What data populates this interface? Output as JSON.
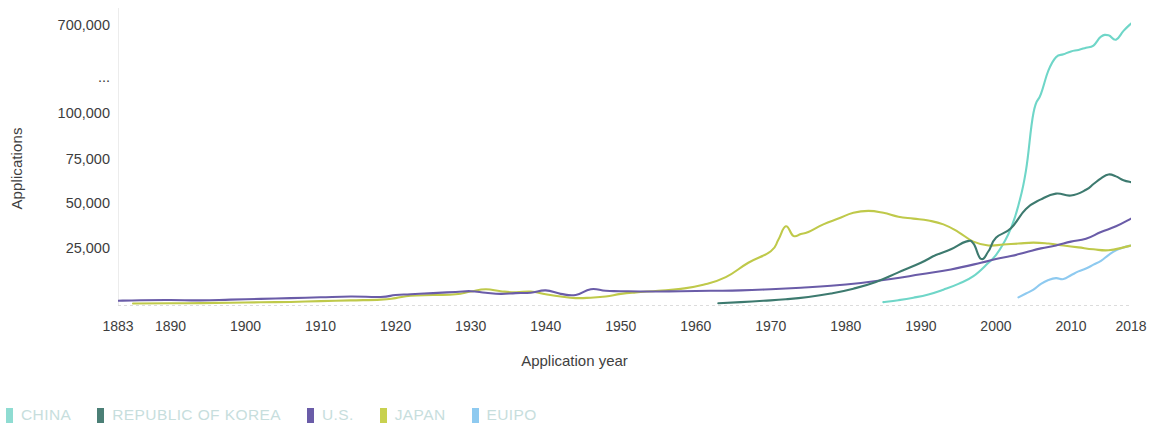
{
  "chart_data": {
    "type": "line",
    "title": "",
    "xlabel": "Application year",
    "ylabel": "Applications",
    "grid": false,
    "legend_position": "bottom-left",
    "axis_note": "y-axis is broken between 100,000 and 700,000, indicated by an ellipsis tick",
    "x_ticks": [
      "1883",
      "1890",
      "1900",
      "1910",
      "1920",
      "1930",
      "1940",
      "1950",
      "1960",
      "1970",
      "1980",
      "1990",
      "2000",
      "2010",
      "2018"
    ],
    "x_tick_values": [
      1883,
      1890,
      1900,
      1910,
      1920,
      1930,
      1940,
      1950,
      1960,
      1970,
      1980,
      1990,
      2000,
      2010,
      2018
    ],
    "y_ticks": [
      "25,000",
      "50,000",
      "75,000",
      "100,000",
      "...",
      "700,000"
    ],
    "y_tick_values": [
      25000,
      50000,
      75000,
      100000,
      null,
      700000
    ],
    "xlim": [
      1883,
      2018
    ],
    "ylim": [
      0,
      700000
    ],
    "series": [
      {
        "name": "CHINA",
        "color": "#6fd6c8",
        "x": [
          1985,
          1987,
          1989,
          1991,
          1993,
          1995,
          1997,
          1999,
          2000,
          2001,
          2002,
          2003,
          2004,
          2005,
          2006,
          2007,
          2008,
          2009,
          2010,
          2011,
          2012,
          2013,
          2014,
          2015,
          2016,
          2017,
          2018
        ],
        "values": [
          1500,
          2500,
          3800,
          5500,
          8000,
          11000,
          15000,
          22000,
          26000,
          32000,
          40000,
          52000,
          70000,
          100000,
          230000,
          390000,
          480000,
          500000,
          520000,
          530000,
          545000,
          560000,
          620000,
          630000,
          600000,
          660000,
          710000
        ]
      },
      {
        "name": "REPUBLIC OF KOREA",
        "color": "#3d7a6f",
        "x": [
          1963,
          1966,
          1969,
          1972,
          1975,
          1978,
          1981,
          1984,
          1987,
          1990,
          1992,
          1994,
          1996,
          1997,
          1998,
          1999,
          2000,
          2002,
          2004,
          2006,
          2008,
          2010,
          2012,
          2013,
          2014,
          2015,
          2016,
          2017,
          2018
        ],
        "values": [
          900,
          1500,
          2200,
          3000,
          4200,
          6000,
          8500,
          12000,
          17000,
          22000,
          26000,
          29000,
          33000,
          32000,
          24000,
          28000,
          35000,
          40000,
          50000,
          55000,
          58000,
          57000,
          60000,
          63000,
          66000,
          68000,
          67000,
          65000,
          64000
        ]
      },
      {
        "name": "U.S.",
        "color": "#6a5ca8",
        "x": [
          1883,
          1886,
          1890,
          1894,
          1898,
          1902,
          1906,
          1910,
          1914,
          1918,
          1920,
          1922,
          1925,
          1928,
          1930,
          1932,
          1934,
          1936,
          1938,
          1940,
          1942,
          1944,
          1946,
          1948,
          1950,
          1954,
          1958,
          1962,
          1966,
          1970,
          1974,
          1978,
          1982,
          1986,
          1990,
          1994,
          1998,
          2000,
          2002,
          2004,
          2006,
          2008,
          2010,
          2012,
          2014,
          2016,
          2018
        ],
        "values": [
          2200,
          2500,
          2600,
          2400,
          2800,
          3200,
          3600,
          4000,
          4400,
          4200,
          5200,
          5600,
          6200,
          6800,
          7200,
          6400,
          5800,
          6200,
          6400,
          7600,
          5800,
          5200,
          8200,
          7400,
          7200,
          7000,
          7200,
          7400,
          7600,
          8200,
          9000,
          10000,
          11500,
          13500,
          16000,
          18500,
          22000,
          24000,
          25500,
          27500,
          29500,
          31000,
          33000,
          34500,
          38000,
          41000,
          45000
        ]
      },
      {
        "name": "JAPAN",
        "color": "#bfc94a",
        "x": [
          1885,
          1890,
          1894,
          1898,
          1902,
          1906,
          1910,
          1914,
          1918,
          1920,
          1922,
          1925,
          1928,
          1930,
          1932,
          1934,
          1936,
          1938,
          1940,
          1942,
          1944,
          1946,
          1948,
          1950,
          1952,
          1955,
          1958,
          1961,
          1964,
          1967,
          1970,
          1971,
          1972,
          1973,
          1974,
          1975,
          1977,
          1979,
          1981,
          1983,
          1985,
          1987,
          1989,
          1991,
          1993,
          1995,
          1997,
          1999,
          2001,
          2003,
          2005,
          2007,
          2009,
          2011,
          2013,
          2015,
          2017,
          2018
        ],
        "values": [
          800,
          900,
          1000,
          1200,
          1400,
          1600,
          2000,
          2400,
          2800,
          3600,
          4800,
          5200,
          5600,
          7000,
          8200,
          7200,
          6600,
          7000,
          5600,
          4400,
          3600,
          3800,
          4400,
          5800,
          6600,
          7400,
          8400,
          10500,
          14500,
          22000,
          28000,
          34000,
          41000,
          36000,
          37000,
          38000,
          42000,
          45000,
          48000,
          49000,
          48000,
          46000,
          45000,
          44000,
          42000,
          38000,
          33000,
          31000,
          31500,
          32000,
          32500,
          32000,
          31000,
          30000,
          29000,
          28500,
          30000,
          31000
        ]
      },
      {
        "name": "EUIPO",
        "color": "#8ecaf0",
        "x": [
          2003,
          2004,
          2005,
          2006,
          2007,
          2008,
          2009,
          2010,
          2011,
          2012,
          2013,
          2014,
          2015,
          2016,
          2017,
          2018
        ],
        "values": [
          4000,
          6000,
          8000,
          11000,
          13000,
          14000,
          13500,
          15500,
          17500,
          19000,
          21000,
          23000,
          26000,
          28500,
          30000,
          31000
        ]
      }
    ]
  },
  "axis": {
    "y_title": "Applications",
    "x_title": "Application year"
  },
  "legend": {
    "items": [
      {
        "label": "CHINA",
        "color": "#8fdcd2"
      },
      {
        "label": "REPUBLIC OF KOREA",
        "color": "#4b7f76"
      },
      {
        "label": "U.S.",
        "color": "#6a5ca8"
      },
      {
        "label": "JAPAN",
        "color": "#c8d14f"
      },
      {
        "label": "EUIPO",
        "color": "#8ecaf0"
      }
    ],
    "label_color": "#c7dedd"
  }
}
